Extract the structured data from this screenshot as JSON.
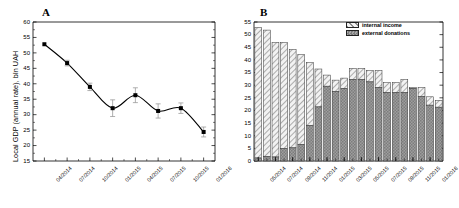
{
  "figure": {
    "panels": [
      {
        "letter": "A",
        "name": "local-gdp-line-chart"
      },
      {
        "letter": "B",
        "name": "income-stacked-bar-chart"
      }
    ]
  },
  "chart_data": [
    {
      "type": "line",
      "panel": "A",
      "title": "A",
      "xlabel": "",
      "ylabel": "Local GDP (annual rate), bln UAH",
      "ylim": [
        15,
        60
      ],
      "yticks": [
        15,
        20,
        25,
        30,
        35,
        40,
        45,
        50,
        55,
        60
      ],
      "grid": false,
      "legend": "none",
      "categories": [
        "04/2014",
        "07/2014",
        "10/2014",
        "01/2015",
        "04/2015",
        "07/2015",
        "10/2015",
        "01/2016"
      ],
      "values": [
        52.8,
        46.7,
        39.0,
        32.1,
        36.3,
        31.2,
        32.1,
        24.4
      ],
      "errors": [
        0.3,
        0.9,
        1.2,
        2.7,
        2.4,
        2.3,
        1.7,
        1.6
      ],
      "marker": "filled-square",
      "smoothed_fit": true
    },
    {
      "type": "bar",
      "subtype": "stacked",
      "panel": "B",
      "title": "B",
      "xlabel": "",
      "ylabel": "",
      "ylim": [
        0,
        55
      ],
      "yticks": [
        0,
        5,
        10,
        15,
        20,
        25,
        30,
        35,
        40,
        45,
        50,
        55
      ],
      "grid": false,
      "legend_position": "top-right",
      "categories": [
        "05/2014",
        "06/2014",
        "07/2014",
        "08/2014",
        "09/2014",
        "10/2014",
        "11/2014",
        "12/2014",
        "01/2015",
        "02/2015",
        "03/2015",
        "04/2015",
        "05/2015",
        "06/2015",
        "07/2015",
        "08/2015",
        "09/2015",
        "10/2015",
        "11/2015",
        "12/2015",
        "01/2016",
        "02/2016"
      ],
      "xtick_labels": [
        "05/2014",
        "07/2014",
        "09/2014",
        "11/2014",
        "01/2015",
        "03/2015",
        "05/2015",
        "07/2015",
        "09/2015",
        "11/2015",
        "01/2016"
      ],
      "series": [
        {
          "name": "external donations",
          "values": [
            1.2,
            1.8,
            1.6,
            5.0,
            5.2,
            6.6,
            14.1,
            21.4,
            29.6,
            27.6,
            28.6,
            32.2,
            32.3,
            31.3,
            29.0,
            27.0,
            27.0,
            27.0,
            28.6,
            25.6,
            22.1,
            21.3
          ]
        },
        {
          "name": "internal income",
          "values": [
            51.6,
            50.0,
            45.3,
            41.9,
            38.9,
            35.5,
            24.8,
            15.0,
            4.4,
            4.4,
            4.2,
            4.4,
            4.3,
            4.5,
            6.8,
            4.0,
            4.0,
            5.2,
            0.4,
            3.4,
            3.3,
            2.7
          ]
        }
      ],
      "totals": [
        52.8,
        51.8,
        46.9,
        46.9,
        44.1,
        42.1,
        38.9,
        36.4,
        34.0,
        32.0,
        32.8,
        36.6,
        36.6,
        35.8,
        35.8,
        31.0,
        31.0,
        32.2,
        29.0,
        29.0,
        25.4,
        24.0
      ]
    }
  ],
  "panelA": {
    "letter": "A",
    "ylabel": "Local GDP (annual rate), bln UAH",
    "yticks": [
      "60",
      "55",
      "50",
      "45",
      "40",
      "35",
      "30",
      "25",
      "20",
      "15"
    ],
    "xticks": [
      "04/2014",
      "07/2014",
      "10/2014",
      "01/2015",
      "04/2015",
      "07/2015",
      "10/2015",
      "01/2016"
    ]
  },
  "panelB": {
    "letter": "B",
    "yticks": [
      "55",
      "50",
      "45",
      "40",
      "35",
      "30",
      "25",
      "20",
      "15",
      "10",
      "5",
      "0"
    ],
    "xticks": [
      "05/2014",
      "07/2014",
      "09/2014",
      "11/2014",
      "01/2015",
      "03/2015",
      "05/2015",
      "07/2015",
      "09/2015",
      "11/2015",
      "01/2016"
    ],
    "legend": {
      "internal": "internal income",
      "external": "external donations"
    }
  }
}
